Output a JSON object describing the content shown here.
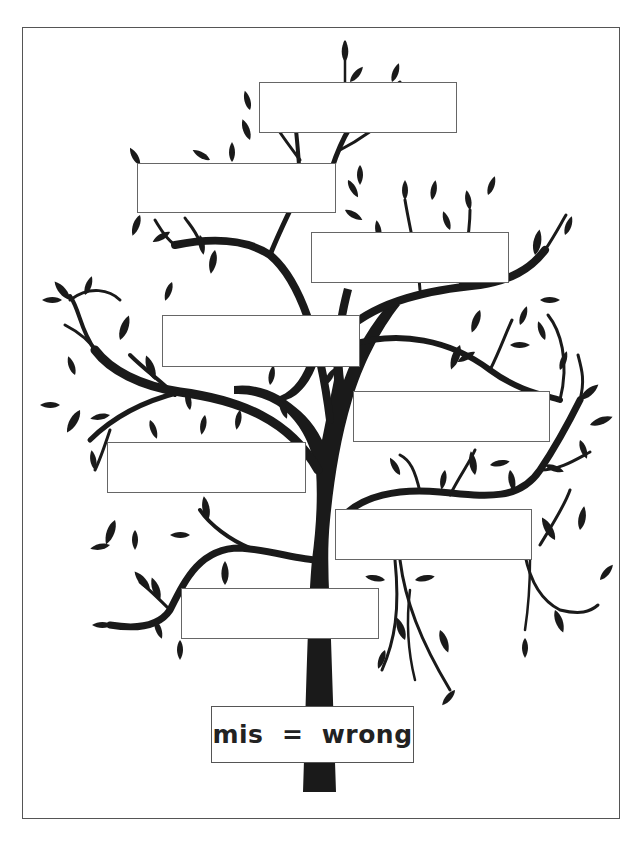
{
  "worksheet": {
    "type": "word-family tree",
    "root": {
      "prefix": "mis",
      "meaning": "wrong",
      "label": "mis  =  wrong"
    },
    "branch_boxes": [
      {
        "id": 1,
        "text": ""
      },
      {
        "id": 2,
        "text": ""
      },
      {
        "id": 3,
        "text": ""
      },
      {
        "id": 4,
        "text": ""
      },
      {
        "id": 5,
        "text": ""
      },
      {
        "id": 6,
        "text": ""
      },
      {
        "id": 7,
        "text": ""
      },
      {
        "id": 8,
        "text": ""
      }
    ]
  },
  "colors": {
    "tree": "#1a1a1a",
    "box_border": "#666666",
    "text": "#222222",
    "background": "#ffffff"
  }
}
